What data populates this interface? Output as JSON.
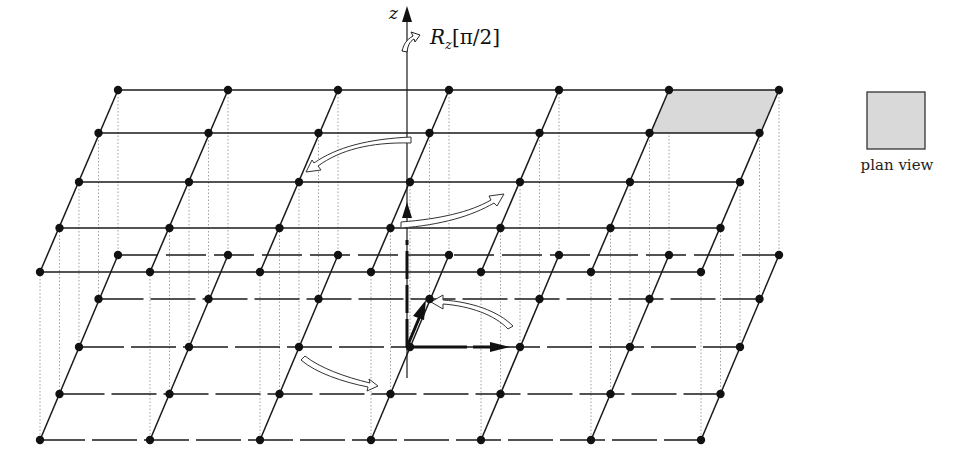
{
  "figure": {
    "axis_label": "z",
    "rotation_label": "R",
    "rotation_subscript": "z",
    "rotation_argument": "[π/2]",
    "plan_view_label": "plan view"
  },
  "colors": {
    "line": "#1a1a1a",
    "node": "#111111",
    "dotted": "#9a9a9a",
    "shaded_cell": "#d9d9d9",
    "arrow_fill": "#ffffff"
  },
  "grid": {
    "upper_plane": {
      "rows_y": [
        90,
        133,
        182,
        228,
        272
      ],
      "row0_x": [
        118,
        228,
        338,
        449,
        559,
        669,
        779
      ],
      "row_shift_x": -19.5,
      "shaded_cell": {
        "row": 0,
        "col": 5
      }
    },
    "lower_plane": {
      "rows_y": [
        255,
        299,
        347,
        394,
        440
      ],
      "row0_x": [
        118,
        228,
        338,
        449,
        559,
        669,
        779
      ],
      "row_shift_x": -19.5
    }
  }
}
